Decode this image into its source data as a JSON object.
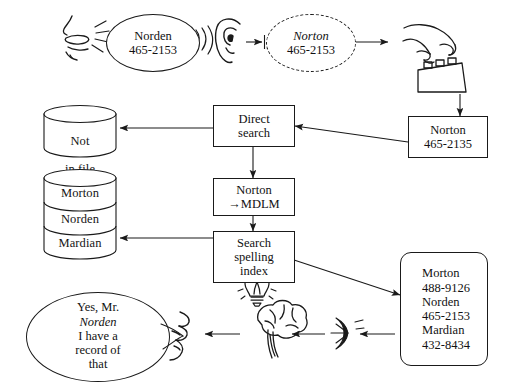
{
  "diagram": {
    "stroke_color": "#1a1a1a",
    "background_color": "#ffffff"
  },
  "stage1": {
    "speaker_icon": "mouth-speaking-icon",
    "sound_waves_icon": "sound-waves-icon",
    "spoken_bubble": {
      "name": "Norden",
      "number": "465-2153"
    },
    "listener_icon": "ear-icon",
    "heard_bubble": {
      "name": "Norton",
      "number": "465-2153"
    },
    "typist_icon": "hand-typing-keyboard-icon"
  },
  "boxes": {
    "typed_entry": {
      "name": "Norton",
      "number": "465-2135"
    },
    "direct_search": {
      "line1": "Direct",
      "line2": "search"
    },
    "normalize": {
      "line1": "Norton",
      "line2": "→MDLM"
    },
    "spelling_index": {
      "line1": "Search",
      "line2": "spelling",
      "line3": "index"
    },
    "results": {
      "entries": [
        {
          "name": "Morton",
          "number": "488-9126"
        },
        {
          "name": "Norden",
          "number": "465-2153"
        },
        {
          "name": "Mardian",
          "number": "432-8434"
        }
      ]
    }
  },
  "cylinders": {
    "not_in_file": {
      "line1": "Not",
      "line2": "in file"
    },
    "file_stack": [
      "Morton",
      "Norden",
      "Mardian"
    ]
  },
  "stage2": {
    "idea_icon": "lightbulb-icon",
    "brain_icon": "brain-icon",
    "reader_icon": "reading-eye-icon",
    "reader_sound_icon": "sound-waves-small-icon",
    "reply_mouth_icon": "mouth-speaking-profile-icon",
    "reply_bubble": {
      "line1": "Yes, Mr.",
      "line2": "Norden",
      "line3": "I have a",
      "line4": "record of",
      "line5": "that"
    }
  }
}
